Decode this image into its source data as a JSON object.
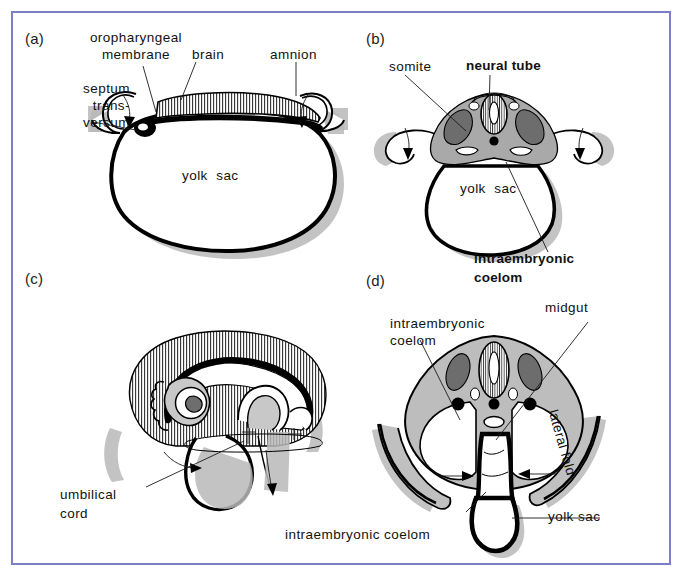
{
  "figure": {
    "border_color": "#7b80c6",
    "background": "#ffffff",
    "width": 688,
    "height": 581
  },
  "panels": [
    {
      "id": "a",
      "letter": "(a)",
      "labels": [
        {
          "key": "oropharyngeal_membrane",
          "text": "oropharyngeal\nmembrane",
          "bold": false
        },
        {
          "key": "brain",
          "text": "brain",
          "bold": false
        },
        {
          "key": "amnion",
          "text": "amnion",
          "bold": false
        },
        {
          "key": "septum_transversum",
          "text": "septum\ntrans-\nversum",
          "bold": false
        },
        {
          "key": "yolk_sac",
          "text": "yolk  sac",
          "bold": false
        }
      ]
    },
    {
      "id": "b",
      "letter": "(b)",
      "labels": [
        {
          "key": "somite",
          "text": "somite",
          "bold": false
        },
        {
          "key": "neural_tube",
          "text": "neural tube",
          "bold": true
        },
        {
          "key": "yolk_sac",
          "text": "yolk  sac",
          "bold": false
        },
        {
          "key": "intraembryonic_coelom",
          "text": "intraembryonic\ncoelom",
          "bold": true
        }
      ]
    },
    {
      "id": "c",
      "letter": "(c)",
      "labels": [
        {
          "key": "umbilical_cord",
          "text": "umbilical\ncord",
          "bold": false
        }
      ]
    },
    {
      "id": "d",
      "letter": "(d)",
      "labels": [
        {
          "key": "intraembryonic_coelom_top",
          "text": "intraembryonic\ncoelom",
          "bold": false
        },
        {
          "key": "midgut",
          "text": "midgut",
          "bold": false
        },
        {
          "key": "lateral_fold",
          "text": "lateral fold",
          "bold": false
        },
        {
          "key": "yolk_sac",
          "text": "yolk sac",
          "bold": false
        },
        {
          "key": "intraembryonic_coelom_bottom",
          "text": "intraembryonic coelom",
          "bold": false
        }
      ]
    }
  ],
  "text": {
    "a_letter": "(a)",
    "b_letter": "(b)",
    "c_letter": "(c)",
    "d_letter": "(d)",
    "a_oropharyngeal_line1": "oropharyngeal",
    "a_oropharyngeal_line2": "membrane",
    "a_brain": "brain",
    "a_amnion": "amnion",
    "a_septum_line1": "septum",
    "a_septum_line2": "trans-",
    "a_septum_line3": "versum",
    "a_yolk_sac": "yolk  sac",
    "b_somite": "somite",
    "b_neural_tube": "neural tube",
    "b_yolk_sac": "yolk  sac",
    "b_coelom_line1": "intraembryonic",
    "b_coelom_line2": "coelom",
    "c_umbilical_line1": "umbilical",
    "c_umbilical_line2": "cord",
    "d_coelom_line1": "intraembryonic",
    "d_coelom_line2": "coelom",
    "d_midgut": "midgut",
    "d_lateral_fold": "lateral fold",
    "d_yolk_sac": "yolk sac",
    "d_coelom_bottom": "intraembryonic coelom"
  }
}
